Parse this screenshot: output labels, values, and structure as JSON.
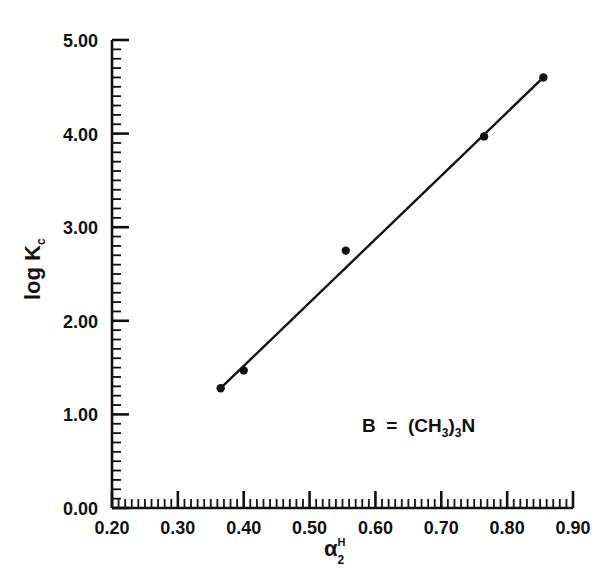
{
  "chart_data": {
    "type": "scatter",
    "title": "",
    "subtitle": "",
    "xlabel": "α",
    "xlabel_sup": "H",
    "xlabel_sub": "2",
    "ylabel_prefix": "log",
    "ylabel_symbol": "K",
    "ylabel_sub": "c",
    "xlim": [
      0.2,
      0.9
    ],
    "ylim": [
      0.0,
      5.0
    ],
    "x_major_step": 0.1,
    "x_minor_step": 0.01,
    "y_major_step": 1.0,
    "y_minor_step": 0.1,
    "grid": false,
    "legend": false,
    "x_tick_labels": [
      "0.20",
      "0.30",
      "0.40",
      "0.50",
      "0.60",
      "0.70",
      "0.80",
      "0.90"
    ],
    "x_tick_values": [
      0.2,
      0.3,
      0.4,
      0.5,
      0.6,
      0.7,
      0.8,
      0.9
    ],
    "y_tick_labels": [
      "0.00",
      "1.00",
      "2.00",
      "3.00",
      "4.00",
      "5.00"
    ],
    "y_tick_values": [
      0.0,
      1.0,
      2.0,
      3.0,
      4.0,
      5.0
    ],
    "series": [
      {
        "name": "log Kc vs alpha2H",
        "marker": "filled-circle",
        "color": "#111111",
        "x": [
          0.365,
          0.4,
          0.555,
          0.765,
          0.855
        ],
        "y": [
          1.28,
          1.47,
          2.75,
          3.97,
          4.6
        ]
      }
    ],
    "fit_line": {
      "name": "least-squares line",
      "color": "#111111",
      "x_start": 0.365,
      "y_start": 1.28,
      "x_end": 0.855,
      "y_end": 4.6
    },
    "annotations": [
      {
        "name": "base-identity",
        "text": "B  =  (CH3)3N",
        "text_parts": {
          "base": "B",
          "equals": "=",
          "open_paren": "(",
          "formula": "CH",
          "formula_sub": "3",
          "close_paren": ")",
          "count_sub": "3",
          "element": "N"
        },
        "x": 0.62,
        "y": 0.9
      }
    ]
  }
}
